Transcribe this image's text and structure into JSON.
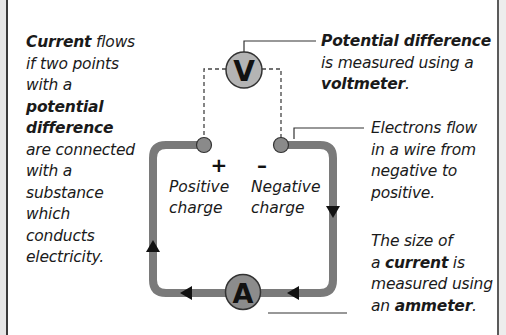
{
  "left_text": {
    "bold_1": "Current",
    "rest_1": " flows",
    "line_2": "if two points",
    "line_3": "with a",
    "bold_2": "potential",
    "bold_3": "difference",
    "line_6": "are connected",
    "line_7": "with a",
    "line_8": "substance",
    "line_9": "which",
    "line_10": "conducts",
    "line_11": "electricity."
  },
  "voltmeter_text": {
    "bold_1": "Potential difference",
    "line_2": "is measured using a",
    "bold_2": "voltmeter",
    "tail": "."
  },
  "electrons_text": {
    "line_1": "Electrons flow",
    "line_2": "in a wire from",
    "line_3": "negative to",
    "line_4": "positive."
  },
  "ammeter_text": {
    "line_1": "The size of",
    "pre_2": "a ",
    "bold_2": "current",
    "post_2": " is",
    "line_3": "measured using",
    "pre_4": "an ",
    "bold_4": "ammeter",
    "tail": "."
  },
  "circuit": {
    "voltmeter_symbol": "V",
    "ammeter_symbol": "A",
    "positive_sign": "+",
    "negative_sign": "–",
    "positive_label_1": "Positive",
    "positive_label_2": "charge",
    "negative_label_1": "Negative",
    "negative_label_2": "charge"
  },
  "colors": {
    "wire": "#7a7a7a",
    "terminal": "#8a8a8a",
    "meter_fill_v": "#b4b4b4",
    "meter_fill_a": "#8c8c8c",
    "text": "#1a1a1a"
  }
}
